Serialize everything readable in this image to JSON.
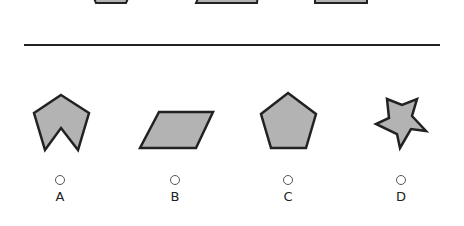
{
  "colors": {
    "shape_fill": "#b3b3b3",
    "shape_stroke": "#222222",
    "divider": "#222222"
  },
  "top_shapes": [
    {
      "name": "partial-shape-1",
      "points": "92,-6 130,-6 126,3 96,3"
    },
    {
      "name": "partial-shape-2",
      "points": "200,-6 258,-6 257,3 196,3"
    },
    {
      "name": "partial-shape-3",
      "points": "315,-6 367,-6 367,3 315,3"
    }
  ],
  "options": [
    {
      "letter": "A",
      "shape": "arrow-chevron",
      "points": "61,95 89,113 78,150 61,128 45,150 34,113",
      "cx": 60
    },
    {
      "letter": "B",
      "shape": "parallelogram",
      "points": "159,112 213,112 196,148 140,148",
      "cx": 175
    },
    {
      "letter": "C",
      "shape": "pentagon",
      "points": "288,93 316,114 306,148 271,148 261,114",
      "cx": 288
    },
    {
      "letter": "D",
      "shape": "star",
      "points": "387,99 402,105 417,99 412,116 426,131 411,129 400,148 397,134 376,124 389,118",
      "cx": 401
    }
  ]
}
